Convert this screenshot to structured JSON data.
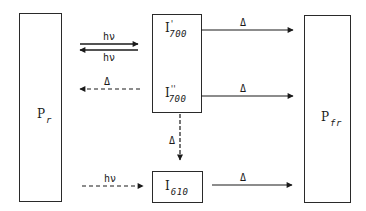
{
  "diagram": {
    "nodes": {
      "p_r": {
        "main": "P",
        "sub": "r",
        "sup": ""
      },
      "i700_prime": {
        "main": "I",
        "sub": "700",
        "sup": "'"
      },
      "i700_double_prime": {
        "main": "I",
        "sub": "700",
        "sup": "''"
      },
      "i610": {
        "main": "I",
        "sub": "610",
        "sup": ""
      },
      "p_fr": {
        "main": "P",
        "sub": "fr",
        "sup": ""
      }
    },
    "edges": [
      {
        "id": "pr-to-i700p",
        "from": "P_r",
        "to": "I'700",
        "label": "hν",
        "style": "solid"
      },
      {
        "id": "i700p-to-pr",
        "from": "I'700",
        "to": "P_r",
        "label": "hν",
        "style": "solid"
      },
      {
        "id": "i700pp-to-pr",
        "from": "I''700",
        "to": "P_r",
        "label": "Δ",
        "style": "dashed"
      },
      {
        "id": "i700p-to-pfr",
        "from": "I'700",
        "to": "P_fr",
        "label": "Δ",
        "style": "solid"
      },
      {
        "id": "i700pp-to-pfr",
        "from": "I''700",
        "to": "P_fr",
        "label": "Δ",
        "style": "solid"
      },
      {
        "id": "i700pp-to-i610",
        "from": "I''700",
        "to": "I610",
        "label": "Δ",
        "style": "dashed"
      },
      {
        "id": "pr-to-i610",
        "from": "P_r",
        "to": "I610",
        "label": "hν",
        "style": "dashed"
      },
      {
        "id": "i610-to-pfr",
        "from": "I610",
        "to": "P_fr",
        "label": "Δ",
        "style": "solid"
      }
    ]
  }
}
